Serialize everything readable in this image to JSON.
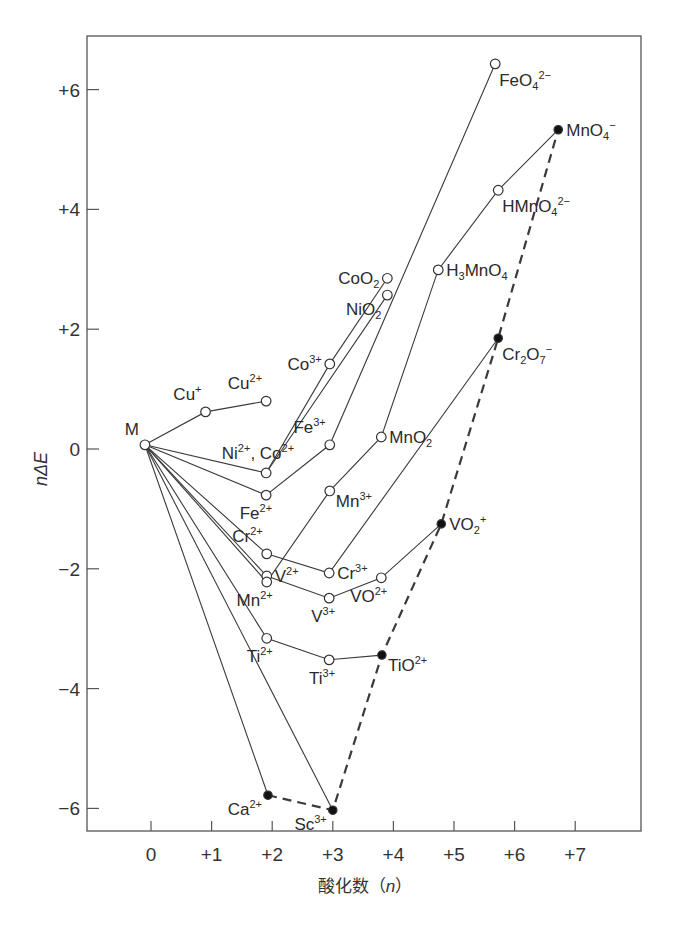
{
  "chart_data": {
    "type": "line",
    "title": "",
    "xlabel": "酸化数（n）",
    "xlabel_var": "n",
    "xlabel_prefix": "酸化数（",
    "xlabel_suffix": "）",
    "ylabel": "nΔE",
    "xlim": [
      -1.2,
      8.1
    ],
    "ylim": [
      -6.4,
      6.9
    ],
    "grid": false,
    "x_ticks": [
      0,
      1,
      2,
      3,
      4,
      5,
      6,
      7
    ],
    "x_tick_labels": [
      "0",
      "+1",
      "+2",
      "+3",
      "+4",
      "+5",
      "+6",
      "+7"
    ],
    "y_ticks": [
      6,
      4,
      2,
      0,
      -2,
      -4,
      -6
    ],
    "y_tick_labels": [
      "+6",
      "+4",
      "+2",
      "0",
      "−2",
      "−4",
      "−6"
    ],
    "points": {
      "M": {
        "x": -0.1,
        "y": 0.07,
        "filled": false,
        "label": [
          [
            "M",
            ""
          ]
        ],
        "anchor": "above-left"
      },
      "Cu+": {
        "x": 0.9,
        "y": 0.62,
        "filled": false,
        "label": [
          [
            "Cu",
            ""
          ],
          [
            "+",
            "sup"
          ]
        ],
        "anchor": "above"
      },
      "Cu2+": {
        "x": 1.9,
        "y": 0.8,
        "filled": false,
        "label": [
          [
            "Cu",
            ""
          ],
          [
            "2+",
            "sup"
          ]
        ],
        "anchor": "above"
      },
      "Ni2+": {
        "x": 1.9,
        "y": -0.4,
        "filled": false,
        "label": [
          [
            "Ni",
            ""
          ],
          [
            "2+",
            "sup"
          ],
          [
            ", Co",
            ""
          ],
          [
            "2+",
            "sup"
          ]
        ],
        "anchor": "above-wide"
      },
      "Co3+": {
        "x": 2.95,
        "y": 1.42,
        "filled": false,
        "label": [
          [
            "Co",
            ""
          ],
          [
            "3+",
            "sup"
          ]
        ],
        "anchor": "left"
      },
      "CoO2": {
        "x": 3.9,
        "y": 2.85,
        "filled": false,
        "label": [
          [
            "CoO",
            ""
          ],
          [
            "2",
            "sub"
          ]
        ],
        "anchor": "left"
      },
      "NiO2": {
        "x": 3.9,
        "y": 2.57,
        "filled": false,
        "label": [
          [
            "NiO",
            ""
          ],
          [
            "2",
            "sub"
          ]
        ],
        "anchor": "below-left"
      },
      "Fe2+": {
        "x": 1.9,
        "y": -0.77,
        "filled": false,
        "label": [
          [
            "Fe",
            ""
          ],
          [
            "2+",
            "sup"
          ]
        ],
        "anchor": "below"
      },
      "Fe3+": {
        "x": 2.95,
        "y": 0.07,
        "filled": false,
        "label": [
          [
            "Fe",
            ""
          ],
          [
            "3+",
            "sup"
          ]
        ],
        "anchor": "above"
      },
      "FeO42-": {
        "x": 5.68,
        "y": 6.43,
        "filled": false,
        "label": [
          [
            "FeO",
            ""
          ],
          [
            "4",
            "sub"
          ],
          [
            "2−",
            "sup"
          ]
        ],
        "anchor": "below-right"
      },
      "Cr2+": {
        "x": 1.91,
        "y": -1.75,
        "filled": false,
        "label": [
          [
            "Cr",
            ""
          ],
          [
            "2+",
            "sup"
          ]
        ],
        "anchor": "above"
      },
      "Cr3+": {
        "x": 2.94,
        "y": -2.07,
        "filled": false,
        "label": [
          [
            "Cr",
            ""
          ],
          [
            "3+",
            "sup"
          ]
        ],
        "anchor": "right"
      },
      "Cr2O7": {
        "x": 5.73,
        "y": 1.85,
        "filled": true,
        "label": [
          [
            "Cr",
            ""
          ],
          [
            "2",
            "sub"
          ],
          [
            "O",
            ""
          ],
          [
            "7",
            "sub"
          ],
          [
            "−",
            "sup"
          ]
        ],
        "anchor": "below-right"
      },
      "V2+": {
        "x": 1.91,
        "y": -2.12,
        "filled": false,
        "label": [
          [
            "V",
            ""
          ],
          [
            "2+",
            "sup"
          ]
        ],
        "anchor": "right"
      },
      "V3+": {
        "x": 2.94,
        "y": -2.49,
        "filled": false,
        "label": [
          [
            "V",
            ""
          ],
          [
            "3+",
            "sup"
          ]
        ],
        "anchor": "below"
      },
      "VO2+": {
        "x": 3.8,
        "y": -2.15,
        "filled": false,
        "label": [
          [
            "VO",
            ""
          ],
          [
            "2+",
            "sup"
          ]
        ],
        "anchor": "below"
      },
      "VO2p": {
        "x": 4.79,
        "y": -1.25,
        "filled": true,
        "label": [
          [
            "VO",
            ""
          ],
          [
            "2",
            "sub"
          ],
          [
            "+",
            "sup"
          ]
        ],
        "anchor": "right"
      },
      "Mn2+": {
        "x": 1.91,
        "y": -2.22,
        "filled": false,
        "label": [
          [
            "Mn",
            ""
          ],
          [
            "2+",
            "sup"
          ]
        ],
        "anchor": "below"
      },
      "Mn3+": {
        "x": 2.95,
        "y": -0.7,
        "filled": false,
        "label": [
          [
            "Mn",
            ""
          ],
          [
            "3+",
            "sup"
          ]
        ],
        "anchor": "right-below"
      },
      "MnO2": {
        "x": 3.8,
        "y": 0.2,
        "filled": false,
        "label": [
          [
            "MnO",
            ""
          ],
          [
            "2",
            "sub"
          ]
        ],
        "anchor": "right"
      },
      "H3MnO4": {
        "x": 4.74,
        "y": 2.99,
        "filled": false,
        "label": [
          [
            "H",
            ""
          ],
          [
            "3",
            "sub"
          ],
          [
            "MnO",
            ""
          ],
          [
            "4",
            "sub"
          ]
        ],
        "anchor": "right"
      },
      "HMnO42-": {
        "x": 5.73,
        "y": 4.32,
        "filled": false,
        "label": [
          [
            "HMnO",
            ""
          ],
          [
            "4",
            "sub"
          ],
          [
            "2−",
            "sup"
          ]
        ],
        "anchor": "below-right"
      },
      "MnO4-": {
        "x": 6.72,
        "y": 5.33,
        "filled": true,
        "label": [
          [
            "MnO",
            ""
          ],
          [
            "4",
            "sub"
          ],
          [
            "−",
            "sup"
          ]
        ],
        "anchor": "right"
      },
      "Ti2+": {
        "x": 1.91,
        "y": -3.16,
        "filled": false,
        "label": [
          [
            "Ti",
            ""
          ],
          [
            "2+",
            "sup"
          ]
        ],
        "anchor": "below"
      },
      "Ti3+": {
        "x": 2.94,
        "y": -3.52,
        "filled": false,
        "label": [
          [
            "Ti",
            ""
          ],
          [
            "3+",
            "sup"
          ]
        ],
        "anchor": "below"
      },
      "TiO2+": {
        "x": 3.81,
        "y": -3.44,
        "filled": true,
        "label": [
          [
            "TiO",
            ""
          ],
          [
            "2+",
            "sup"
          ]
        ],
        "anchor": "right-below"
      },
      "Ca2+": {
        "x": 1.93,
        "y": -5.78,
        "filled": true,
        "label": [
          [
            "Ca",
            ""
          ],
          [
            "2+",
            "sup"
          ]
        ],
        "anchor": "below-left"
      },
      "Sc3+": {
        "x": 3.0,
        "y": -6.03,
        "filled": true,
        "label": [
          [
            "Sc",
            ""
          ],
          [
            "3+",
            "sup"
          ]
        ],
        "anchor": "below-left"
      }
    },
    "series": [
      {
        "name": "Cu",
        "style": "solid",
        "path": [
          "M",
          "Cu+",
          "Cu2+"
        ]
      },
      {
        "name": "Ni",
        "style": "solid",
        "path": [
          "M",
          "Ni2+",
          "NiO2"
        ]
      },
      {
        "name": "Co",
        "style": "solid",
        "path": [
          "Ni2+",
          "Co3+",
          "CoO2"
        ]
      },
      {
        "name": "Fe",
        "style": "solid",
        "path": [
          "M",
          "Fe2+",
          "Fe3+",
          "FeO42-"
        ]
      },
      {
        "name": "Mn",
        "style": "solid",
        "path": [
          "M",
          "Mn2+",
          "Mn3+",
          "MnO2",
          "H3MnO4",
          "HMnO42-",
          "MnO4-"
        ]
      },
      {
        "name": "Cr",
        "style": "solid",
        "path": [
          "M",
          "Cr2+",
          "Cr3+",
          "Cr2O7"
        ]
      },
      {
        "name": "V",
        "style": "solid",
        "path": [
          "M",
          "V2+",
          "V3+",
          "VO2+",
          "VO2p"
        ]
      },
      {
        "name": "Ti",
        "style": "solid",
        "path": [
          "M",
          "Ti2+",
          "Ti3+",
          "TiO2+"
        ]
      },
      {
        "name": "Ca",
        "style": "solid",
        "path": [
          "M",
          "Ca2+"
        ]
      },
      {
        "name": "Sc",
        "style": "solid",
        "path": [
          "M",
          "Sc3+"
        ]
      },
      {
        "name": "max-oxidation",
        "style": "dashed",
        "path": [
          "Ca2+",
          "Sc3+",
          "TiO2+",
          "VO2p",
          "Cr2O7",
          "MnO4-"
        ]
      }
    ]
  }
}
